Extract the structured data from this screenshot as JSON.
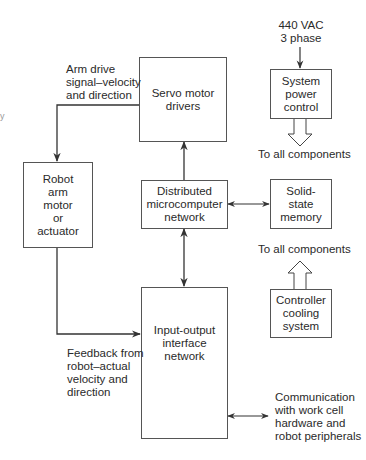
{
  "diagram": {
    "type": "block-diagram",
    "blocks": {
      "servo": "Servo motor\ndrivers",
      "robot_arm": "Robot\narm\nmotor\nor\nactuator",
      "distributed": "Distributed\nmicrocomputer\nnetwork",
      "io": "Input-output\ninterface\nnetwork",
      "power": "System\npower\ncontrol",
      "memory": "Solid-\nstate\nmemory",
      "cooling": "Controller\ncooling\nsystem"
    },
    "labels": {
      "arm_drive": "Arm drive\nsignal–velocity\nand direction",
      "power_input": "440 VAC\n3 phase",
      "to_all_1": "To all components",
      "to_all_2": "To all components",
      "feedback": "Feedback from\nrobot–actual\nvelocity and\ndirection",
      "communication": "Communication\nwith work cell\nhardware and\nrobot peripherals",
      "stray": "y"
    },
    "edges": [
      {
        "from": "servo",
        "to": "robot_arm",
        "label": "arm_drive"
      },
      {
        "from": "distributed",
        "to": "servo"
      },
      {
        "from": "distributed",
        "to": "memory",
        "bidirectional": true
      },
      {
        "from": "distributed",
        "to": "io",
        "bidirectional": true
      },
      {
        "from": "robot_arm",
        "to": "io",
        "label": "feedback"
      },
      {
        "from": "power_input",
        "to": "power"
      },
      {
        "from": "power",
        "to": "to_all_1"
      },
      {
        "from": "cooling",
        "to": "to_all_2"
      },
      {
        "from": "io",
        "to": "communication",
        "bidirectional": true
      }
    ],
    "colors": {
      "line": "#333333",
      "box_border": "#555555",
      "text": "#2a2a2a"
    }
  }
}
